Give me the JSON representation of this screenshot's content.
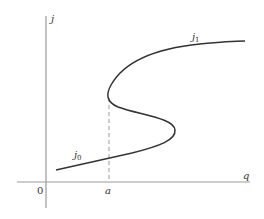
{
  "figure": {
    "type": "S-shaped response curve (hysteresis) diagram",
    "axes": {
      "y_label": "j",
      "x_label": "q",
      "origin_label": "0",
      "x_tick_label": "a"
    },
    "curves": {
      "lower_branch_label": "j",
      "lower_branch_subscript": "0",
      "upper_branch_label": "j",
      "upper_branch_subscript": "1"
    },
    "colors": {
      "axis": "#9a9a9a",
      "curve": "#333333",
      "dashed": "#9a9a9a",
      "text": "#333333",
      "background": "#ffffff"
    }
  }
}
